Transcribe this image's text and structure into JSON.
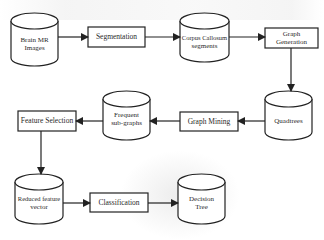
{
  "diagram": {
    "type": "flowchart",
    "nodes": [
      {
        "id": "brain_mr",
        "shape": "cylinder",
        "label": "Brain MR Images",
        "lines": [
          "Brain MR",
          "Images"
        ]
      },
      {
        "id": "segmentation",
        "shape": "rect",
        "label": "Segmentation"
      },
      {
        "id": "corpus",
        "shape": "cylinder",
        "label": "Corpus Callosum segments",
        "lines": [
          "Corpus Callosum",
          "segments"
        ]
      },
      {
        "id": "graph_gen",
        "shape": "rect",
        "label": "Graph Generation",
        "lines": [
          "Graph",
          "Generation"
        ]
      },
      {
        "id": "quadtrees",
        "shape": "cylinder",
        "label": "Quadtrees"
      },
      {
        "id": "graph_mining",
        "shape": "rect",
        "label": "Graph Mining"
      },
      {
        "id": "frequent",
        "shape": "cylinder",
        "label": "Frequent sub-graphs",
        "lines": [
          "Frequent",
          "sub-graphs"
        ]
      },
      {
        "id": "feature_sel",
        "shape": "rect",
        "label": "Feature Selection"
      },
      {
        "id": "reduced",
        "shape": "cylinder",
        "label": "Reduced feature vector",
        "lines": [
          "Reduced feature",
          "vector"
        ]
      },
      {
        "id": "classification",
        "shape": "rect",
        "label": "Classification"
      },
      {
        "id": "decision_tree",
        "shape": "cylinder",
        "label": "Decision Tree",
        "lines": [
          "Decision",
          "Tree"
        ]
      }
    ],
    "edges": [
      [
        "brain_mr",
        "segmentation"
      ],
      [
        "segmentation",
        "corpus"
      ],
      [
        "corpus",
        "graph_gen"
      ],
      [
        "graph_gen",
        "quadtrees"
      ],
      [
        "quadtrees",
        "graph_mining"
      ],
      [
        "graph_mining",
        "frequent"
      ],
      [
        "frequent",
        "feature_sel"
      ],
      [
        "feature_sel",
        "reduced"
      ],
      [
        "reduced",
        "classification"
      ],
      [
        "classification",
        "decision_tree"
      ]
    ]
  },
  "colors": {
    "stroke": "#222222",
    "text": "#2a2a2a",
    "background": "#ffffff"
  }
}
